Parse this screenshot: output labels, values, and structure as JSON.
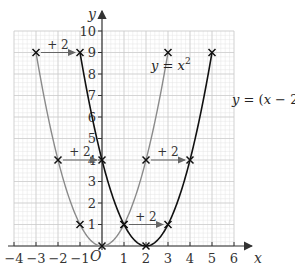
{
  "chart_data": {
    "type": "line",
    "title": "",
    "xlabel": "x",
    "ylabel": "y",
    "origin_label": "O",
    "xlim": [
      -4,
      6
    ],
    "ylim": [
      0,
      10
    ],
    "x_ticks": [
      -4,
      -3,
      -2,
      -1,
      1,
      2,
      3,
      4,
      5,
      6
    ],
    "y_ticks": [
      1,
      2,
      3,
      4,
      5,
      6,
      7,
      8,
      9,
      10
    ],
    "grid": {
      "major": 1,
      "minor": 0.2,
      "on": true
    },
    "series": [
      {
        "name": "y = x^2",
        "label_parts": [
          "y = x",
          "2"
        ],
        "color": "#8a8a8a",
        "domain": [
          -3,
          3
        ],
        "marked_points": [
          [
            -3,
            9
          ],
          [
            -2,
            4
          ],
          [
            -1,
            1
          ],
          [
            0,
            0
          ],
          [
            1,
            1
          ],
          [
            2,
            4
          ],
          [
            3,
            9
          ]
        ]
      },
      {
        "name": "y = (x - 2)^2",
        "label_parts": [
          "y = (x − 2)",
          "2"
        ],
        "color": "#111111",
        "domain": [
          -1,
          5
        ],
        "marked_points": [
          [
            -1,
            9
          ],
          [
            0,
            4
          ],
          [
            1,
            1
          ],
          [
            2,
            0
          ],
          [
            3,
            1
          ],
          [
            4,
            4
          ],
          [
            5,
            9
          ]
        ]
      }
    ],
    "annotations": [
      {
        "type": "arrow",
        "from": [
          -3,
          9
        ],
        "to": [
          -1,
          9
        ],
        "label": "+ 2"
      },
      {
        "type": "arrow",
        "from": [
          -2,
          4
        ],
        "to": [
          0,
          4
        ],
        "label": "+ 2"
      },
      {
        "type": "arrow",
        "from": [
          2,
          4
        ],
        "to": [
          4,
          4
        ],
        "label": "+ 2"
      },
      {
        "type": "arrow",
        "from": [
          1,
          1
        ],
        "to": [
          3,
          1
        ],
        "label": "+ 2"
      }
    ]
  }
}
